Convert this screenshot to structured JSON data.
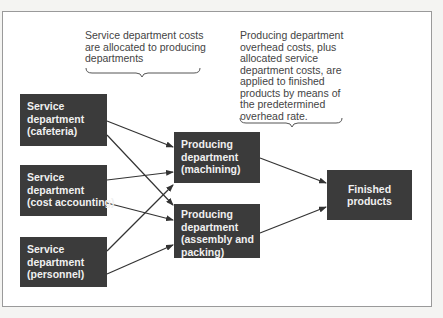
{
  "diagram": {
    "type": "flow",
    "colors": {
      "box_fill": "#3b3b3b",
      "box_text": "#f0f0f0",
      "note_text": "#444444",
      "arrow": "#333333",
      "frame_border": "#9a9a9a"
    },
    "notes": {
      "allocation": {
        "lines": [
          "Service department costs",
          "are allocated to producing",
          "departments"
        ]
      },
      "application": {
        "lines": [
          "Producing department",
          "overhead costs, plus",
          "allocated service",
          "department costs, are",
          "applied to finished",
          "products by means of",
          "the predetermined",
          "overhead rate."
        ]
      }
    },
    "service_departments": [
      {
        "id": "cafeteria",
        "lines": [
          "Service",
          "department",
          "(cafeteria)"
        ]
      },
      {
        "id": "cost_accounting",
        "lines": [
          "Service",
          "department",
          "(cost accounting)"
        ]
      },
      {
        "id": "personnel",
        "lines": [
          "Service",
          "department",
          "(personnel)"
        ]
      }
    ],
    "producing_departments": [
      {
        "id": "machining",
        "lines": [
          "Producing",
          "department",
          "(machining)"
        ]
      },
      {
        "id": "assembly",
        "lines": [
          "Producing",
          "department",
          "(assembly and",
          "packing)"
        ]
      }
    ],
    "output": {
      "id": "finished_products",
      "lines": [
        "Finished",
        "products"
      ]
    },
    "edges": [
      {
        "from": "cafeteria",
        "to": "machining"
      },
      {
        "from": "cafeteria",
        "to": "assembly"
      },
      {
        "from": "cost_accounting",
        "to": "machining"
      },
      {
        "from": "cost_accounting",
        "to": "assembly"
      },
      {
        "from": "personnel",
        "to": "machining"
      },
      {
        "from": "personnel",
        "to": "assembly"
      },
      {
        "from": "machining",
        "to": "finished_products"
      },
      {
        "from": "assembly",
        "to": "finished_products"
      }
    ]
  }
}
